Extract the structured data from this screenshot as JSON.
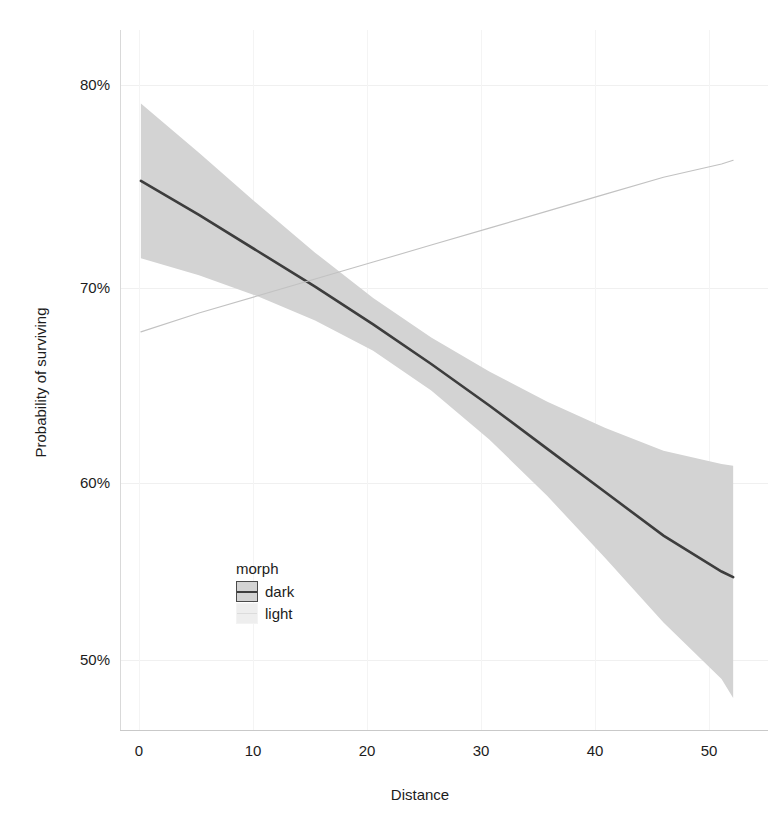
{
  "chart_data": {
    "type": "line",
    "title": "",
    "subtitle": "",
    "xlabel": "Distance",
    "ylabel": "Probability of surviving",
    "xlim": [
      -1.8,
      54.0
    ],
    "ylim": [
      0.465,
      0.836
    ],
    "xticks": [
      0,
      10,
      20,
      30,
      40,
      50
    ],
    "xticklabels": [
      "0",
      "10",
      "20",
      "30",
      "40",
      "50"
    ],
    "yticks": [
      0.5,
      0.6,
      0.7,
      0.8
    ],
    "yticklabels": [
      "50%",
      "60%",
      "70%",
      "80%"
    ],
    "grid": true,
    "legend": {
      "title": "morph",
      "position": "inside-bottom-left",
      "entries": [
        {
          "label": "dark",
          "line_color": "#3d3d3d",
          "ribbon_color": "#d3d3d3"
        },
        {
          "label": "light",
          "line_color": "#c2c2c2",
          "ribbon_color": "#f0f0f0"
        }
      ]
    },
    "series": [
      {
        "name": "dark",
        "x": [
          0,
          5,
          10,
          15,
          20,
          25,
          30,
          35,
          40,
          45,
          50,
          51
        ],
        "y": [
          0.756,
          0.738,
          0.719,
          0.7,
          0.68,
          0.659,
          0.637,
          0.614,
          0.591,
          0.568,
          0.549,
          0.546
        ],
        "ci_lower": [
          0.715,
          0.706,
          0.695,
          0.682,
          0.666,
          0.645,
          0.619,
          0.589,
          0.556,
          0.522,
          0.492,
          0.482
        ],
        "ci_upper": [
          0.797,
          0.771,
          0.744,
          0.718,
          0.694,
          0.673,
          0.655,
          0.639,
          0.625,
          0.613,
          0.606,
          0.605
        ]
      },
      {
        "name": "light",
        "x": [
          0,
          5,
          10,
          15,
          20,
          25,
          30,
          35,
          40,
          45,
          50,
          51
        ],
        "y": [
          0.676,
          0.686,
          0.695,
          0.704,
          0.713,
          0.722,
          0.731,
          0.74,
          0.749,
          0.758,
          0.765,
          0.767
        ],
        "ci_lower": [
          0.676,
          0.686,
          0.695,
          0.704,
          0.713,
          0.722,
          0.731,
          0.74,
          0.749,
          0.758,
          0.765,
          0.767
        ],
        "ci_upper": [
          0.676,
          0.686,
          0.695,
          0.704,
          0.713,
          0.722,
          0.731,
          0.74,
          0.749,
          0.758,
          0.765,
          0.767
        ]
      }
    ],
    "annotations": []
  },
  "axes": {
    "y_title": "Probability of surviving",
    "x_title": "Distance",
    "y_ticks": [
      "80%",
      "70%",
      "60%",
      "50%"
    ],
    "x_ticks": [
      "0",
      "10",
      "20",
      "30",
      "40",
      "50"
    ]
  },
  "legend": {
    "title": "morph",
    "items": [
      {
        "label": "dark"
      },
      {
        "label": "light"
      }
    ]
  }
}
